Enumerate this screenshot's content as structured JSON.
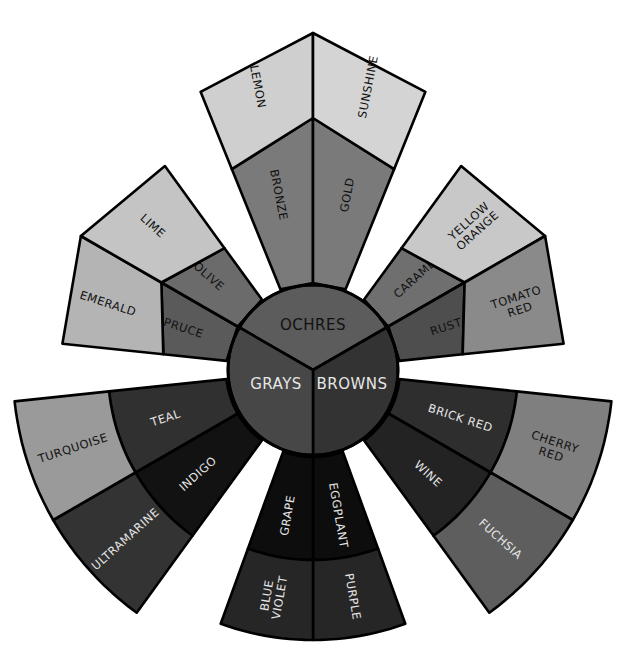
{
  "diagram": {
    "type": "color-wheel",
    "hub": [
      {
        "label": "OCHRES",
        "color": "#5c5c5c",
        "text_color": "#111111"
      },
      {
        "label": "BROWNS",
        "color": "#333333",
        "text_color": "#e6e6e6"
      },
      {
        "label": "GRAYS",
        "color": "#474747",
        "text_color": "#e6e6e6"
      }
    ],
    "wedges": [
      {
        "group": "OCHRES",
        "segments": [
          {
            "label": [
              "BRONZE"
            ],
            "band": "inner",
            "side": "left",
            "color": "#7a7a7a",
            "text_color": "#111111"
          },
          {
            "label": [
              "GOLD"
            ],
            "band": "inner",
            "side": "right",
            "color": "#7a7a7a",
            "text_color": "#111111"
          },
          {
            "label": [
              "LEMON"
            ],
            "band": "outer",
            "side": "left",
            "color": "#cfcfcf",
            "text_color": "#111111"
          },
          {
            "label": [
              "SUNSHINE"
            ],
            "band": "outer",
            "side": "right",
            "color": "#d4d4d4",
            "text_color": "#111111"
          }
        ]
      },
      {
        "group": "BROWNS",
        "segments": [
          {
            "label": [
              "CARAMEL"
            ],
            "band": "inner",
            "side": "left",
            "color": "#6f6f6f",
            "text_color": "#111111"
          },
          {
            "label": [
              "RUST"
            ],
            "band": "inner",
            "side": "right",
            "color": "#4e4e4e",
            "text_color": "#111111"
          },
          {
            "label": [
              "YELLOW",
              "ORANGE"
            ],
            "band": "outer",
            "side": "left",
            "color": "#c8c8c8",
            "text_color": "#111111"
          },
          {
            "label": [
              "TOMATO",
              "RED"
            ],
            "band": "outer",
            "side": "right",
            "color": "#8a8a8a",
            "text_color": "#111111"
          }
        ]
      },
      {
        "group": "BROWNS",
        "segments": [
          {
            "label": [
              "BRICK RED"
            ],
            "band": "inner",
            "side": "left",
            "color": "#2e2e2e",
            "text_color": "#e6e6e6"
          },
          {
            "label": [
              "WINE"
            ],
            "band": "inner",
            "side": "right",
            "color": "#232323",
            "text_color": "#e6e6e6"
          },
          {
            "label": [
              "CHERRY",
              "RED"
            ],
            "band": "outer",
            "side": "left",
            "color": "#7f7f7f",
            "text_color": "#111111"
          },
          {
            "label": [
              "FUCHSIA"
            ],
            "band": "outer",
            "side": "right",
            "color": "#5e5e5e",
            "text_color": "#e6e6e6"
          }
        ]
      },
      {
        "group": "PURPLES",
        "segments": [
          {
            "label": [
              "EGGPLANT"
            ],
            "band": "inner",
            "side": "left",
            "color": "#0d0d0d",
            "text_color": "#e6e6e6"
          },
          {
            "label": [
              "GRAPE"
            ],
            "band": "inner",
            "side": "right",
            "color": "#0d0d0d",
            "text_color": "#e6e6e6"
          },
          {
            "label": [
              "PURPLE"
            ],
            "band": "outer",
            "side": "left",
            "color": "#262626",
            "text_color": "#e6e6e6"
          },
          {
            "label": [
              "BLUE",
              "VIOLET"
            ],
            "band": "outer",
            "side": "right",
            "color": "#262626",
            "text_color": "#e6e6e6"
          }
        ]
      },
      {
        "group": "GRAYS",
        "segments": [
          {
            "label": [
              "INDIGO"
            ],
            "band": "inner",
            "side": "left",
            "color": "#121212",
            "text_color": "#e6e6e6"
          },
          {
            "label": [
              "TEAL"
            ],
            "band": "inner",
            "side": "right",
            "color": "#303030",
            "text_color": "#e6e6e6"
          },
          {
            "label": [
              "ULTRAMARINE"
            ],
            "band": "outer",
            "side": "left",
            "color": "#333333",
            "text_color": "#e6e6e6"
          },
          {
            "label": [
              "TURQUOISE"
            ],
            "band": "outer",
            "side": "right",
            "color": "#9a9a9a",
            "text_color": "#111111"
          }
        ]
      },
      {
        "group": "GRAYS",
        "segments": [
          {
            "label": [
              "SPRUCE"
            ],
            "band": "inner",
            "side": "left",
            "color": "#5a5a5a",
            "text_color": "#111111"
          },
          {
            "label": [
              "OLIVE"
            ],
            "band": "inner",
            "side": "right",
            "color": "#6b6b6b",
            "text_color": "#111111"
          },
          {
            "label": [
              "EMERALD"
            ],
            "band": "outer",
            "side": "left",
            "color": "#b4b4b4",
            "text_color": "#111111"
          },
          {
            "label": [
              "LIME"
            ],
            "band": "outer",
            "side": "right",
            "color": "#c4c4c4",
            "text_color": "#111111"
          }
        ]
      }
    ]
  }
}
